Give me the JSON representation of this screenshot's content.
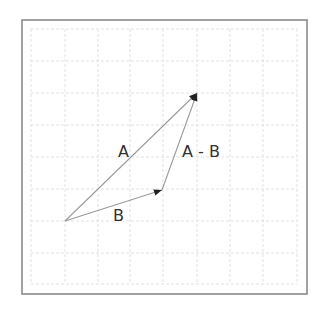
{
  "diagram": {
    "type": "vector-subtraction",
    "frame": {
      "x": 22,
      "y": 20,
      "width": 285,
      "height": 274,
      "color": "#8a8a8a"
    },
    "grid": {
      "x_lines": [
        31,
        65,
        98,
        130,
        163,
        197,
        230,
        263,
        297
      ],
      "y_lines": [
        29,
        61,
        93,
        125,
        157,
        189,
        221,
        253,
        284
      ],
      "color": "#e2e2e2",
      "style": "dashed"
    },
    "points": {
      "origin": {
        "x": 65,
        "y": 221
      },
      "tip_a": {
        "x": 197,
        "y": 93
      },
      "tip_b": {
        "x": 162,
        "y": 190
      }
    },
    "vectors": [
      {
        "name": "A",
        "from": "origin",
        "to": "tip_a",
        "color": "#9a9a9a"
      },
      {
        "name": "B",
        "from": "origin",
        "to": "tip_b",
        "color": "#9a9a9a"
      },
      {
        "name": "A - B",
        "from": "tip_b",
        "to": "tip_a",
        "color": "#9a9a9a"
      }
    ],
    "arrowhead_color": "#222222",
    "labels": {
      "a": {
        "text": "A",
        "x": 118,
        "y": 144
      },
      "a_minus_b": {
        "text": "A - B",
        "x": 182,
        "y": 144
      },
      "b": {
        "text": "B",
        "x": 113,
        "y": 208
      }
    }
  }
}
